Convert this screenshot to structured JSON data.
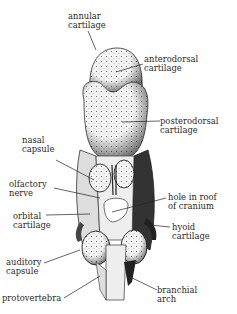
{
  "diagram": {
    "title": "",
    "labels": {
      "annular": "annular\ncartilage",
      "anterodorsal": "anterodorsal\ncartilage",
      "posterodorsal": "posterodorsal\ncartilage",
      "nasal_capsule": "nasal\ncapsule",
      "olfactory_nerve": "olfactory\nnerve",
      "hole_in_roof": "hole in roof\nof cranium",
      "orbital": "orbital\ncartilage",
      "hyoid": "hyoid\ncartilage",
      "auditory": "auditory\ncapsule",
      "protovertebra": "protovertebra",
      "branchial": "branchial\narch"
    }
  }
}
